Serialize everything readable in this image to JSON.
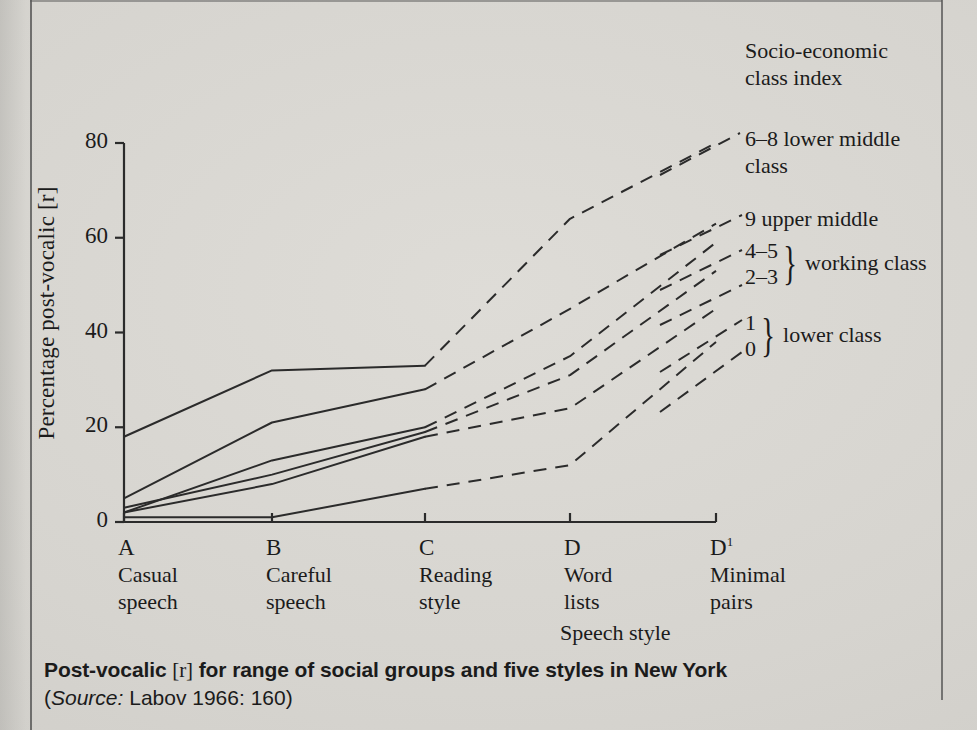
{
  "figure": {
    "caption_main": "Post-vocalic [r] for range of social groups and five styles in New York",
    "caption_main_a": "Post-vocalic",
    "caption_main_b": "[r]",
    "caption_main_c": "for range of social groups and five styles in New York",
    "caption_source_prefix": "(",
    "caption_source_italic": "Source:",
    "caption_source_rest": " Labov 1966: 160)"
  },
  "legend": {
    "title_line1": "Socio-economic",
    "title_line2": "class index",
    "entries": [
      {
        "key": "6-8",
        "line1": "6–8 lower middle",
        "line2": "class"
      },
      {
        "key": "9",
        "line1": "9 upper middle",
        "line2": ""
      }
    ],
    "working_class": {
      "num_top": "4–5",
      "num_bottom": "2–3",
      "brace": "}",
      "label": "working class"
    },
    "lower_class": {
      "num_top": "1",
      "num_bottom": "0",
      "brace": "}",
      "label": "lower class"
    }
  },
  "chart_data": {
    "type": "line",
    "title": "Post-vocalic [r] for range of social groups and five styles in New York",
    "xlabel": "Speech style",
    "ylabel": "Percentage post-vocalic [r]",
    "ylim": [
      0,
      84
    ],
    "yticks": [
      0,
      20,
      40,
      60,
      80
    ],
    "ytick_labels": [
      "0",
      "20",
      "40",
      "60",
      "80"
    ],
    "grid": false,
    "legend_position": "right",
    "categories": [
      "A",
      "B",
      "C",
      "D",
      "D1"
    ],
    "category_labels": [
      {
        "letter": "A",
        "sup": "",
        "line1": "Casual",
        "line2": "speech"
      },
      {
        "letter": "B",
        "sup": "",
        "line1": "Careful",
        "line2": "speech"
      },
      {
        "letter": "C",
        "sup": "",
        "line1": "Reading",
        "line2": "style"
      },
      {
        "letter": "D",
        "sup": "",
        "line1": "Word",
        "line2": "lists"
      },
      {
        "letter": "D",
        "sup": "1",
        "line1": "Minimal",
        "line2": "pairs"
      }
    ],
    "dash_after_category": "C",
    "series": [
      {
        "name": "9 upper middle",
        "values": [
          18,
          32,
          33,
          64,
          80
        ]
      },
      {
        "name": "6–8 lower middle",
        "values": [
          5,
          21,
          28,
          45,
          63
        ]
      },
      {
        "name": "4–5 working class",
        "values": [
          2,
          13,
          20,
          35,
          59
        ]
      },
      {
        "name": "2–3 working class",
        "values": [
          3,
          10,
          19,
          31,
          53
        ]
      },
      {
        "name": "1 lower class",
        "values": [
          2,
          8,
          18,
          24,
          45
        ]
      },
      {
        "name": "0 lower class",
        "values": [
          1,
          1,
          7,
          12,
          38
        ]
      }
    ],
    "axis_color": "#2b2b2b",
    "line_color": "#2b2b2b"
  },
  "axis": {
    "x_axis_caption": "Speech style"
  }
}
